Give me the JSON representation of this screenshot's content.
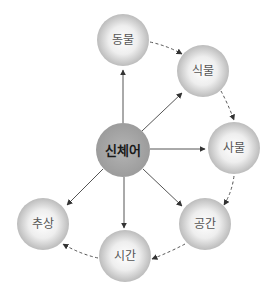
{
  "diagram": {
    "center": {
      "label": "신체어",
      "x": 123,
      "y": 150,
      "r": 27
    },
    "nodes": [
      {
        "id": "animal",
        "label": "동물",
        "x": 123,
        "y": 40,
        "r": 26
      },
      {
        "id": "plant",
        "label": "식물",
        "x": 203,
        "y": 71,
        "r": 26
      },
      {
        "id": "object",
        "label": "사물",
        "x": 234,
        "y": 148,
        "r": 26
      },
      {
        "id": "space",
        "label": "공간",
        "x": 205,
        "y": 224,
        "r": 26
      },
      {
        "id": "time",
        "label": "시간",
        "x": 125,
        "y": 256,
        "r": 26
      },
      {
        "id": "abstract",
        "label": "추상",
        "x": 43,
        "y": 224,
        "r": 26
      }
    ],
    "solid_edges_from_center_to": [
      "animal",
      "plant",
      "object",
      "space",
      "time",
      "abstract"
    ],
    "dashed_chain": [
      "animal",
      "plant",
      "object",
      "space",
      "time",
      "abstract"
    ],
    "colors": {
      "center_fill": "#a9a9a9",
      "node_light": "#ffffff",
      "node_dark": "#bdbdbd",
      "edge": "#444444"
    }
  }
}
